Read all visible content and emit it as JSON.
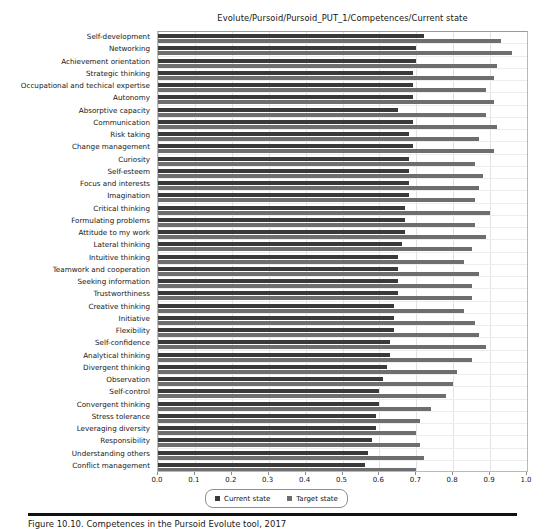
{
  "chart_data": {
    "type": "bar",
    "orientation": "horizontal",
    "title": "Evolute/Pursoid/Pursoid_PUT_1/Competences/Current state",
    "xlabel": "",
    "ylabel": "",
    "xlim": [
      0.0,
      1.0
    ],
    "grid": true,
    "legend_position": "below-axis-center",
    "xticks": [
      "0.0",
      "0.1",
      "0.2",
      "0.3",
      "0.4",
      "0.5",
      "0.6",
      "0.7",
      "0.8",
      "0.9",
      "1.0"
    ],
    "xtick_values": [
      0.0,
      0.1,
      0.2,
      0.3,
      0.4,
      0.5,
      0.6,
      0.7,
      0.8,
      0.9,
      1.0
    ],
    "categories": [
      "Self-development",
      "Networking",
      "Achievement orientation",
      "Strategic thinking",
      "Occupational and techical expertise",
      "Autonomy",
      "Absorptive capacity",
      "Communication",
      "Risk taking",
      "Change management",
      "Curiosity",
      "Self-esteem",
      "Focus and interests",
      "Imagination",
      "Critical thinking",
      "Formulating problems",
      "Attitude to my work",
      "Lateral thinking",
      "Intuitive thinking",
      "Teamwork and cooperation",
      "Seeking information",
      "Trustworthiness",
      "Creative thinking",
      "Initiative",
      "Flexibility",
      "Self-confidence",
      "Analytical thinking",
      "Divergent thinking",
      "Observation",
      "Self-control",
      "Convergent thinking",
      "Stress tolerance",
      "Leveraging diversity",
      "Responsibility",
      "Understanding others",
      "Conflict management"
    ],
    "series": [
      {
        "name": "Current state",
        "color": "#3a3a3a",
        "values": [
          0.72,
          0.7,
          0.7,
          0.69,
          0.69,
          0.69,
          0.65,
          0.69,
          0.68,
          0.69,
          0.68,
          0.68,
          0.68,
          0.68,
          0.67,
          0.67,
          0.67,
          0.66,
          0.65,
          0.65,
          0.65,
          0.65,
          0.64,
          0.64,
          0.64,
          0.63,
          0.63,
          0.62,
          0.61,
          0.6,
          0.6,
          0.59,
          0.59,
          0.58,
          0.57,
          0.56
        ]
      },
      {
        "name": "Target state",
        "color": "#6e6e6e",
        "values": [
          0.93,
          0.96,
          0.92,
          0.91,
          0.89,
          0.91,
          0.89,
          0.92,
          0.87,
          0.91,
          0.86,
          0.88,
          0.87,
          0.86,
          0.9,
          0.86,
          0.89,
          0.85,
          0.83,
          0.87,
          0.85,
          0.85,
          0.83,
          0.86,
          0.87,
          0.89,
          0.85,
          0.81,
          0.8,
          0.78,
          0.74,
          0.71,
          0.7,
          0.71,
          0.72,
          0.7
        ]
      }
    ]
  },
  "legend": {
    "items": [
      {
        "label": "Current state",
        "swatch": "current"
      },
      {
        "label": "Target state",
        "swatch": "target"
      }
    ]
  },
  "caption": {
    "text": "Figure 10.10. Competences in the Pursoid Evolute tool, 2017"
  }
}
